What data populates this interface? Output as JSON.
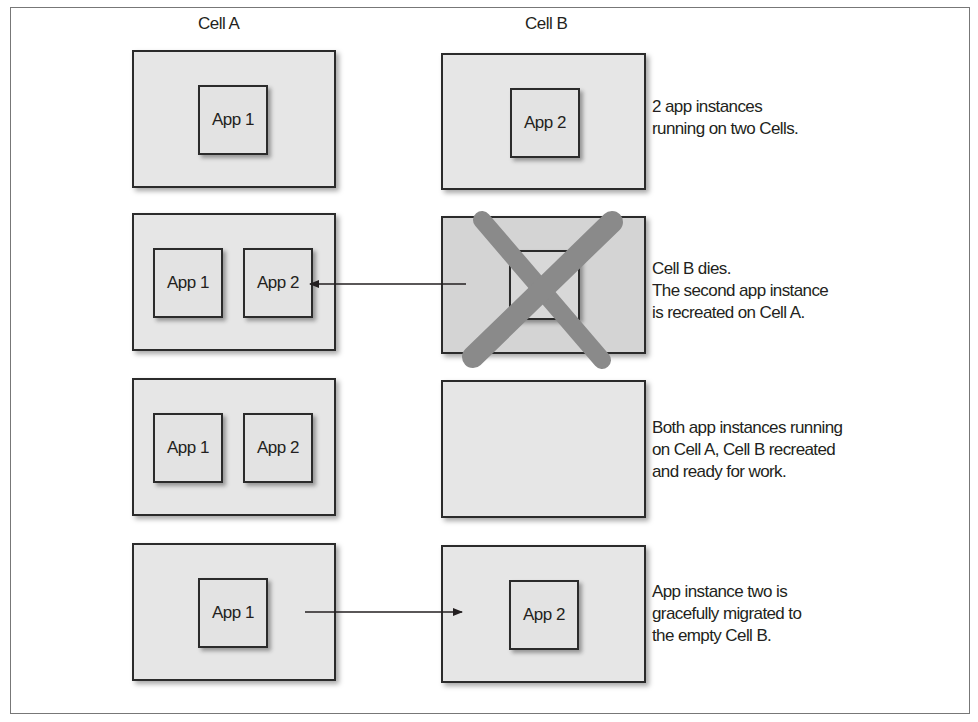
{
  "columns": {
    "a": "Cell A",
    "b": "Cell B"
  },
  "rows": [
    {
      "cell_a_apps": [
        "App 1"
      ],
      "cell_b_apps": [
        "App 2"
      ],
      "caption": [
        "2 app instances",
        "running on two Cells."
      ]
    },
    {
      "cell_a_apps": [
        "App 1",
        "App 2"
      ],
      "cell_b_apps": [
        ""
      ],
      "cell_b_state": "dead",
      "caption": [
        "Cell B dies.",
        "The second app instance",
        "is recreated on Cell A."
      ]
    },
    {
      "cell_a_apps": [
        "App 1",
        "App 2"
      ],
      "cell_b_apps": [],
      "caption": [
        "Both app instances running",
        "on Cell A, Cell B recreated",
        "and ready for work."
      ]
    },
    {
      "cell_a_apps": [
        "App 1"
      ],
      "cell_b_apps": [
        "App 2"
      ],
      "caption": [
        "App instance two is",
        "gracefully migrated to",
        "the empty Cell B."
      ]
    }
  ],
  "colors": {
    "cell_fill": "#e6e6e6",
    "border": "#2b2b2b",
    "x_mark": "#8a8a8a"
  }
}
